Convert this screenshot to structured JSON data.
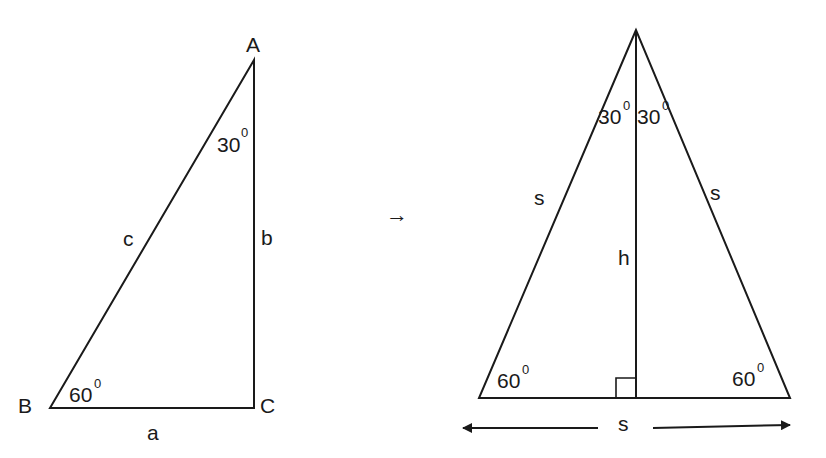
{
  "left_triangle": {
    "vertices": {
      "A": "A",
      "B": "B",
      "C": "C"
    },
    "sides": {
      "hypotenuse": "c",
      "vertical": "b",
      "base": "a"
    },
    "angles": {
      "at_A": "30",
      "at_B": "60"
    },
    "degree_mark": "0"
  },
  "transition_arrow": "→",
  "right_triangle": {
    "sides": {
      "left": "s",
      "right": "s",
      "height": "h",
      "base": "s"
    },
    "angles": {
      "apex_left": "30",
      "apex_right": "30",
      "base_left": "60",
      "base_right": "60"
    },
    "degree_mark": "0"
  },
  "colors": {
    "stroke": "#1a1a1a",
    "background": "#ffffff"
  }
}
